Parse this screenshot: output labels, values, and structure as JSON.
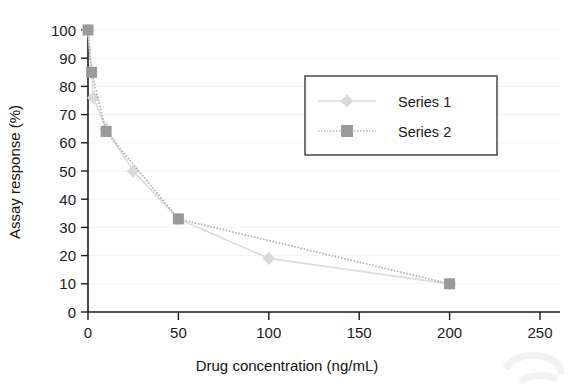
{
  "chart_data": {
    "type": "line",
    "title": "",
    "xlabel": "Drug concentration (ng/mL)",
    "ylabel": "Assay response (%)",
    "xlim": [
      0,
      250
    ],
    "ylim": [
      0,
      100
    ],
    "xticks": [
      0,
      50,
      100,
      150,
      200,
      250
    ],
    "yticks": [
      0,
      10,
      20,
      30,
      40,
      50,
      60,
      70,
      80,
      90,
      100
    ],
    "grid": false,
    "legend_position": "upper-right-inside",
    "series": [
      {
        "name": "Series 1",
        "marker": "diamond",
        "color": "#d9d9d9",
        "line_style": "solid",
        "points": [
          {
            "x": 0,
            "y": 100
          },
          {
            "x": 3,
            "y": 76
          },
          {
            "x": 10,
            "y": 65
          },
          {
            "x": 25,
            "y": 50
          },
          {
            "x": 50,
            "y": 33
          },
          {
            "x": 100,
            "y": 19
          },
          {
            "x": 200,
            "y": 10
          }
        ]
      },
      {
        "name": "Series 2",
        "marker": "square",
        "color": "#9a9a9a",
        "line_style": "dotted",
        "points": [
          {
            "x": 0,
            "y": 100
          },
          {
            "x": 2,
            "y": 85
          },
          {
            "x": 10,
            "y": 64
          },
          {
            "x": 50,
            "y": 33
          },
          {
            "x": 200,
            "y": 10
          }
        ]
      }
    ]
  },
  "axes": {
    "x_tick_labels": [
      "0",
      "50",
      "100",
      "150",
      "200",
      "250"
    ],
    "y_tick_labels": [
      "0",
      "10",
      "20",
      "30",
      "40",
      "50",
      "60",
      "70",
      "80",
      "90",
      "100"
    ],
    "x_axis_title": "Drug concentration (ng/mL)",
    "y_axis_title": "Assay response (%)"
  },
  "legend": {
    "entries": [
      {
        "label": "Series 1",
        "marker": "diamond-marker",
        "swatch_color": "#d9d9d9"
      },
      {
        "label": "Series 2",
        "marker": "square-marker",
        "swatch_color": "#9a9a9a"
      }
    ]
  },
  "colors": {
    "series1": "#d9d9d9",
    "series2": "#9a9a9a",
    "axis": "#1a1a1a",
    "background": "#ffffff"
  }
}
